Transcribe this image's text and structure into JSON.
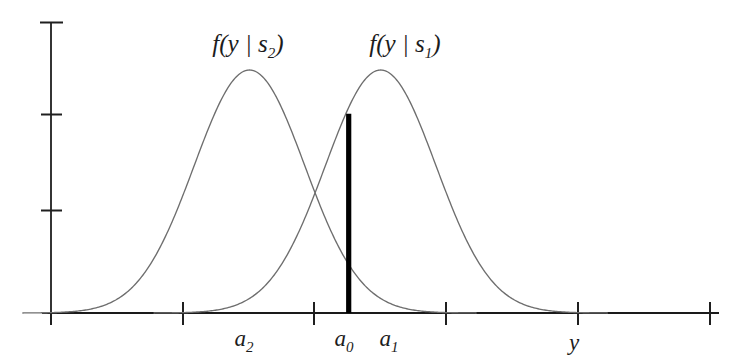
{
  "figure": {
    "title": "",
    "background_color": "#ffffff",
    "axis_color": "#1a1a1a",
    "curve_color": "#6e6e6e",
    "threshold_color": "#000000"
  },
  "labels": {
    "curve_left": {
      "base": "f(y | s",
      "sub": "2",
      "close": ")"
    },
    "curve_right": {
      "base": "f(y | s",
      "sub": "1",
      "close": ")"
    },
    "axis_x": "y",
    "tick_a2": {
      "base": "a",
      "sub": "2"
    },
    "tick_a0": {
      "base": "a",
      "sub": "0"
    },
    "tick_a1": {
      "base": "a",
      "sub": "1"
    }
  },
  "chart_data": {
    "type": "line",
    "title": "",
    "subtitle": "",
    "xlabel": "y",
    "ylabel": "",
    "grid": false,
    "legend_position": "inline-above-curves",
    "xlim": [
      0,
      10
    ],
    "ylim": [
      0,
      1.2
    ],
    "x_ticks": [
      0,
      2,
      4,
      6,
      8,
      10
    ],
    "x_tick_labels": [
      "",
      "a_2",
      "",
      "a_1",
      "",
      ""
    ],
    "y_ticks": [
      0,
      0.4,
      0.8,
      1.2
    ],
    "y_tick_labels": [
      "",
      "",
      "",
      ""
    ],
    "series": [
      {
        "name": "f(y | s_2)",
        "type": "gaussian-density",
        "mean": 2.98,
        "sigma": 0.83,
        "peak_height": 1.0,
        "label_x": 2.98,
        "label_y": 1.13,
        "color": "#6e6e6e"
      },
      {
        "name": "f(y | s_1)",
        "type": "gaussian-density",
        "mean": 4.95,
        "sigma": 0.83,
        "peak_height": 1.0,
        "label_x": 5.35,
        "label_y": 1.13,
        "color": "#6e6e6e"
      }
    ],
    "annotations": [
      {
        "name": "threshold-bar",
        "label": "a_0",
        "x": 4.47,
        "y_from": 0,
        "y_to": 0.82,
        "style": "thick-vertical-line",
        "color": "#000000"
      },
      {
        "name": "crossing-point",
        "x": 3.95,
        "y": 0.45
      }
    ],
    "axis_markers": [
      {
        "name": "a_2",
        "x": 2.98
      },
      {
        "name": "a_0",
        "x": 4.47
      },
      {
        "name": "a_1",
        "x": 4.95
      }
    ]
  }
}
